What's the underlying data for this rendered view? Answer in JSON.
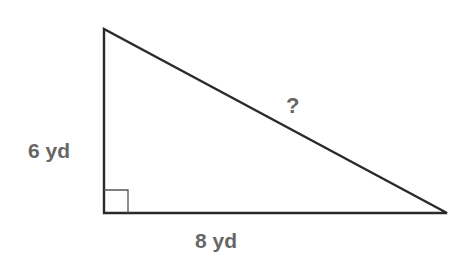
{
  "diagram": {
    "type": "right-triangle",
    "vertices": {
      "top": [
        104,
        29
      ],
      "right_angle": [
        104,
        213
      ],
      "right": [
        447,
        213
      ]
    },
    "right_angle_marker_size": 24,
    "stroke_color": "#2a2a2a",
    "label_color": "#666666",
    "labels": {
      "vertical_leg": "6 yd",
      "horizontal_leg": "8 yd",
      "hypotenuse": "?"
    }
  }
}
